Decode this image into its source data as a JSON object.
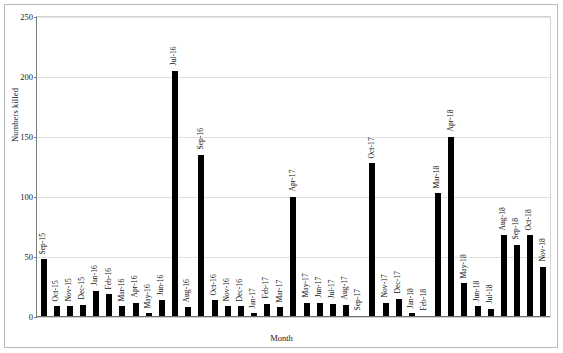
{
  "chart_data": {
    "type": "bar",
    "title": "",
    "xlabel": "Month",
    "ylabel": "Numbers killed",
    "ylim": [
      0,
      250
    ],
    "yticks": [
      0,
      50,
      100,
      150,
      200,
      250
    ],
    "grid": true,
    "legend": "none",
    "bar_color": "#000000",
    "categories": [
      "Sep-15",
      "Oct-15",
      "Nov-15",
      "Dec-15",
      "Jan-16",
      "Feb-16",
      "Mar-16",
      "Apr-16",
      "May-16",
      "Jun-16",
      "Jul-16",
      "Aug-16",
      "Sep-16",
      "Oct-16",
      "Nov-16",
      "Dec-16",
      "Jan-17",
      "Feb-17",
      "Mar-17",
      "Apr-17",
      "May-17",
      "Jun-17",
      "Jul-17",
      "Aug-17",
      "Sep-17",
      "Oct-17",
      "Nov-17",
      "Dec-17",
      "Jan-18",
      "Feb-18",
      "Mar-18",
      "Apr-18",
      "May-18",
      "Jun-18",
      "Jul-18",
      "Aug-18",
      "Sep-18",
      "Oct-18",
      "Nov-18"
    ],
    "values": [
      48,
      9,
      9,
      10,
      22,
      19,
      9,
      12,
      3,
      14,
      205,
      8,
      135,
      14,
      9,
      9,
      3,
      11,
      8,
      100,
      12,
      12,
      11,
      10,
      1,
      128,
      12,
      15,
      3,
      1,
      103,
      150,
      28,
      9,
      7,
      68,
      60,
      68,
      42
    ]
  }
}
